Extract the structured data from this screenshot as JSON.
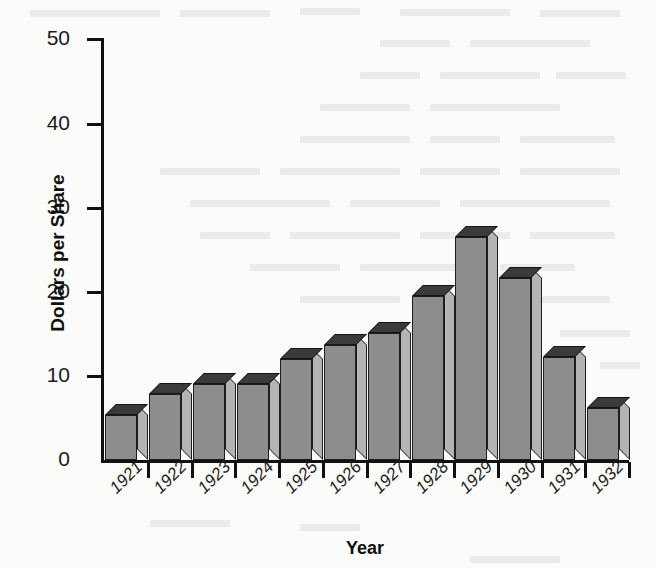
{
  "chart_data": {
    "type": "bar",
    "title": "",
    "subtitle": "",
    "xlabel": "Year",
    "ylabel": "Dollars per Share",
    "categories": [
      "1921",
      "1922",
      "1923",
      "1924",
      "1925",
      "1926",
      "1927",
      "1928",
      "1929",
      "1930",
      "1931",
      "1932"
    ],
    "values": [
      5.3,
      7.8,
      9.0,
      9.0,
      12.0,
      13.6,
      15.1,
      19.5,
      26.5,
      21.6,
      12.2,
      6.2
    ],
    "ylim": [
      0,
      50
    ],
    "ytick_labels": [
      "0",
      "10",
      "20",
      "30",
      "40",
      "50"
    ],
    "ytick_values": [
      0,
      10,
      20,
      30,
      40,
      50
    ],
    "grid": false,
    "legend": null,
    "annotations": [],
    "style": "3d-bar",
    "colors": {
      "bar_front": "#8d8d8d",
      "bar_top": "#3b3b3b",
      "bar_side": "#b4b4b4",
      "outline": "#1d1d1d",
      "axis": "#111111",
      "text": "#1a1a1a",
      "background": "#fbfbf9"
    }
  },
  "axis": {
    "y_title": "Dollars per Share",
    "x_title": "Year"
  }
}
